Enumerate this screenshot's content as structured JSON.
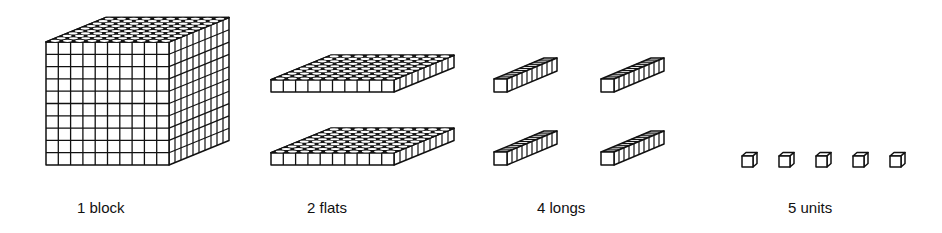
{
  "figure": {
    "groups": [
      {
        "id": "block",
        "label": "1 block",
        "count": 1,
        "units_per_piece": 1000
      },
      {
        "id": "flats",
        "label": "2 flats",
        "count": 2,
        "units_per_piece": 100
      },
      {
        "id": "longs",
        "label": "4 longs",
        "count": 4,
        "units_per_piece": 10
      },
      {
        "id": "units",
        "label": "5 units",
        "count": 5,
        "units_per_piece": 1
      }
    ]
  }
}
